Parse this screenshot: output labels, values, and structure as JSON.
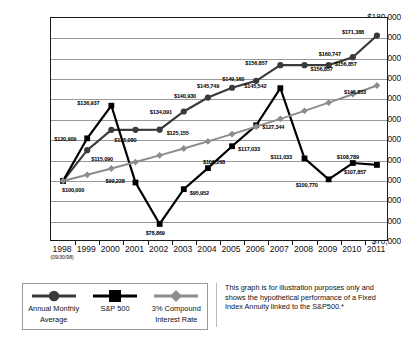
{
  "chart_data": {
    "type": "line",
    "title": "",
    "xlabel": "",
    "ylabel": "",
    "ylim": [
      70000,
      180000
    ],
    "ytick_step": 10000,
    "grid": true,
    "legend_position": "bottom-left",
    "categories": [
      "1998",
      "1999",
      "2000",
      "2001",
      "2002",
      "2003",
      "2004",
      "2005",
      "2006",
      "2007",
      "2008",
      "2009",
      "2010",
      "2011"
    ],
    "x_subnote": "(09/30/98)",
    "ytick_labels": [
      "$180,000",
      "$170,000",
      "$160,000",
      "$150,000",
      "$140,000",
      "$130,000",
      "$120,000",
      "$110,000",
      "$100,000",
      "$90,000",
      "$80,000",
      "$70,000"
    ],
    "series": [
      {
        "name": "Annual Monthly Average",
        "marker": "circle",
        "color": "#3a3a3a",
        "values": [
          100000,
          115090,
          125080,
          125080,
          125155,
          134091,
          140930,
          145749,
          149160,
          156857,
          156857,
          156857,
          160747,
          171388
        ],
        "labels": [
          "$100,000",
          "$115,090",
          "$125,080",
          "",
          "$125,155",
          "$134,091",
          "$140,930",
          "$145,749",
          "$149,160",
          "$156,857",
          "$156,857",
          "$156,857",
          "$160,747",
          "$171,388"
        ]
      },
      {
        "name": "S&P 500",
        "marker": "square",
        "color": "#000000",
        "values": [
          100000,
          120909,
          136937,
          99228,
          78869,
          95952,
          106268,
          117033,
          127344,
          145542,
          111033,
          100770,
          108789,
          107857
        ],
        "labels": [
          "",
          "$120,909",
          "$136,937",
          "$99,228",
          "$78,869",
          "$95,952",
          "$106,268",
          "$117,033",
          "$127,344",
          "$145,542",
          "$111,033",
          "$100,770",
          "$108,789",
          "$107,857"
        ]
      },
      {
        "name": "3% Compound Interest Rate",
        "marker": "diamond",
        "color": "#8c8c8c",
        "values": [
          100000,
          103000,
          106090,
          109273,
          112551,
          115927,
          119405,
          122987,
          126677,
          130477,
          134392,
          138423,
          142576,
          146853
        ],
        "labels": [
          "",
          "",
          "",
          "",
          "",
          "",
          "",
          "",
          "",
          "",
          "",
          "",
          "",
          "$146,853"
        ]
      }
    ]
  },
  "legend": {
    "items": [
      {
        "label_line1": "Annual Monthly",
        "label_line2": "Average",
        "marker": "circle-marker",
        "color": "#3a3a3a"
      },
      {
        "label_line1": "S&P 500",
        "label_line2": "",
        "marker": "square-marker",
        "color": "#000000"
      },
      {
        "label_line1": "3% Compound",
        "label_line2": "Interest Rate",
        "marker": "diamond-marker",
        "color": "#8c8c8c"
      }
    ]
  },
  "caption": {
    "text": "This graph is for illustration purposes only and shows the hypothetical performance of a Fixed Index Annuity linked to the S&P500.*"
  },
  "label_offsets": {
    "annual": [
      {
        "dx": -1,
        "dy": 9,
        "anchor": "start"
      },
      {
        "dx": 4,
        "dy": 9,
        "anchor": "start"
      },
      {
        "dx": 3,
        "dy": 10,
        "anchor": "start"
      },
      {
        "dx": 0,
        "dy": 0,
        "anchor": "none"
      },
      {
        "dx": 7,
        "dy": 3,
        "anchor": "start"
      },
      {
        "dx": -34,
        "dy": 1,
        "anchor": "start"
      },
      {
        "dx": -34,
        "dy": -2,
        "anchor": "start"
      },
      {
        "dx": -35,
        "dy": -2,
        "anchor": "start"
      },
      {
        "dx": -34,
        "dy": -2,
        "anchor": "start"
      },
      {
        "dx": -35,
        "dy": -2,
        "anchor": "start"
      },
      {
        "dx": 6,
        "dy": 4,
        "anchor": "start"
      },
      {
        "dx": 6,
        "dy": -1,
        "anchor": "start"
      },
      {
        "dx": -34,
        "dy": -3,
        "anchor": "start"
      },
      {
        "dx": -35,
        "dy": -4,
        "anchor": "start"
      }
    ],
    "sp500": [
      {
        "dx": 0,
        "dy": 0,
        "anchor": "none"
      },
      {
        "dx": -33,
        "dy": 1,
        "anchor": "start"
      },
      {
        "dx": -34,
        "dy": -3,
        "anchor": "start"
      },
      {
        "dx": -30,
        "dy": -1,
        "anchor": "start"
      },
      {
        "dx": -14,
        "dy": 9,
        "anchor": "start"
      },
      {
        "dx": 6,
        "dy": 4,
        "anchor": "start"
      },
      {
        "dx": -5,
        "dy": -6,
        "anchor": "start"
      },
      {
        "dx": 6,
        "dy": 3,
        "anchor": "start"
      },
      {
        "dx": 6,
        "dy": 2,
        "anchor": "start"
      },
      {
        "dx": -36,
        "dy": -2,
        "anchor": "start"
      },
      {
        "dx": -34,
        "dy": -1,
        "anchor": "start"
      },
      {
        "dx": -33,
        "dy": 6,
        "anchor": "start"
      },
      {
        "dx": -16,
        "dy": -6,
        "anchor": "start"
      },
      {
        "dx": -33,
        "dy": 7,
        "anchor": "start"
      }
    ],
    "compound": [
      {
        "dx": 0,
        "dy": 0,
        "anchor": "none"
      },
      {
        "dx": 0,
        "dy": 0,
        "anchor": "none"
      },
      {
        "dx": 0,
        "dy": 0,
        "anchor": "none"
      },
      {
        "dx": 0,
        "dy": 0,
        "anchor": "none"
      },
      {
        "dx": 0,
        "dy": 0,
        "anchor": "none"
      },
      {
        "dx": 0,
        "dy": 0,
        "anchor": "none"
      },
      {
        "dx": 0,
        "dy": 0,
        "anchor": "none"
      },
      {
        "dx": 0,
        "dy": 0,
        "anchor": "none"
      },
      {
        "dx": 0,
        "dy": 0,
        "anchor": "none"
      },
      {
        "dx": 0,
        "dy": 0,
        "anchor": "none"
      },
      {
        "dx": 0,
        "dy": 0,
        "anchor": "none"
      },
      {
        "dx": 0,
        "dy": 0,
        "anchor": "none"
      },
      {
        "dx": 0,
        "dy": 0,
        "anchor": "none"
      },
      {
        "dx": -33,
        "dy": 7,
        "anchor": "start"
      }
    ]
  }
}
